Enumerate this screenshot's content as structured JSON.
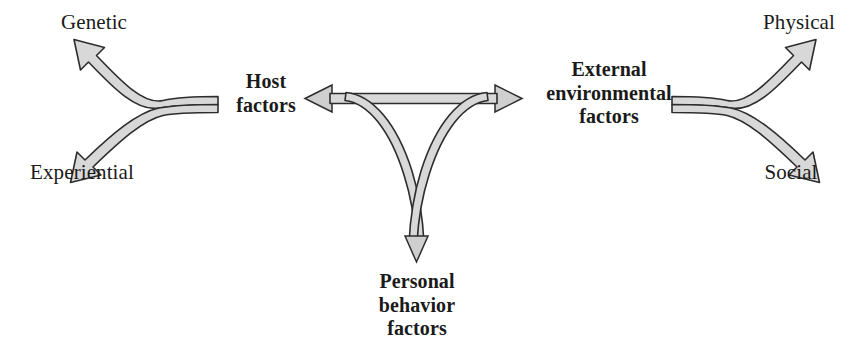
{
  "diagram": {
    "title": "",
    "background_color": "#ffffff",
    "arrow_fill_color": "#d9d9d9",
    "arrow_stroke_color": "#2b2b2b",
    "text_color": "#1a1a1a",
    "nodes": [
      {
        "id": "genetic",
        "label": "Genetic",
        "style": "plain",
        "role": "leaf"
      },
      {
        "id": "experiential",
        "label": "Experiential",
        "style": "plain",
        "role": "leaf"
      },
      {
        "id": "host",
        "label": "Host\nfactors",
        "style": "bold",
        "role": "core"
      },
      {
        "id": "external",
        "label": "External\nenvironmental\nfactors",
        "style": "bold",
        "role": "core"
      },
      {
        "id": "personal",
        "label": "Personal\nbehavior\nfactors",
        "style": "bold",
        "role": "core"
      },
      {
        "id": "physical",
        "label": "Physical",
        "style": "plain",
        "role": "leaf"
      },
      {
        "id": "social",
        "label": "Social",
        "style": "plain",
        "role": "leaf"
      }
    ],
    "edges": [
      {
        "id": "host-genetic",
        "from": "host",
        "to": "genetic",
        "direction": "one-way"
      },
      {
        "id": "host-experiential",
        "from": "host",
        "to": "experiential",
        "direction": "one-way"
      },
      {
        "id": "host-external",
        "from": "host",
        "to": "external",
        "direction": "two-way"
      },
      {
        "id": "center-personal",
        "from": "host-external-junction",
        "to": "personal",
        "direction": "one-way"
      },
      {
        "id": "external-physical",
        "from": "external",
        "to": "physical",
        "direction": "one-way"
      },
      {
        "id": "external-social",
        "from": "external",
        "to": "social",
        "direction": "one-way"
      }
    ]
  }
}
